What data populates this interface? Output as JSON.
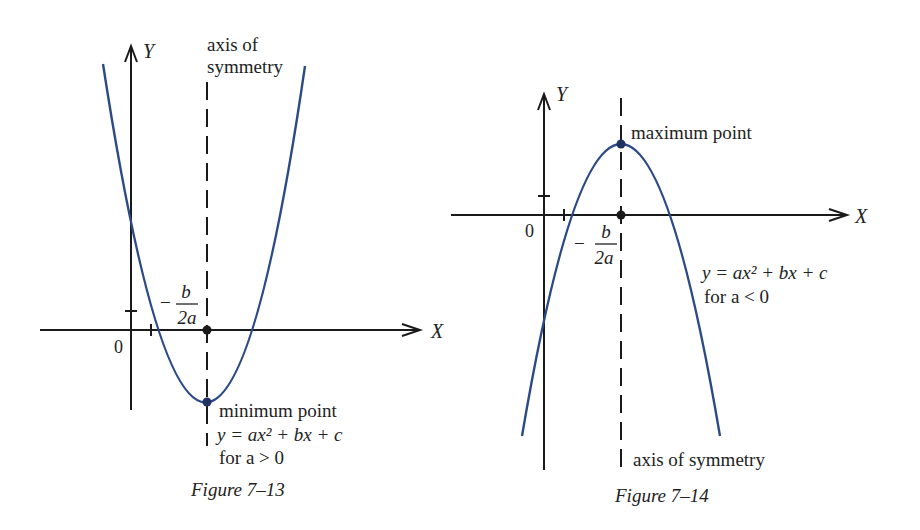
{
  "colors": {
    "axis": "#1a1a1a",
    "curve": "#2b4a86",
    "text": "#222222",
    "background": "#ffffff"
  },
  "figures": [
    {
      "caption": "Figure 7–13",
      "y_axis_label": "Y",
      "x_axis_label": "X",
      "origin_label": "0",
      "vertex_x_label_num": "b",
      "vertex_x_label_den": "2a",
      "vertex_x_label_sign": "−",
      "symmetry_label_line1": "axis of",
      "symmetry_label_line2": "symmetry",
      "point_label": "minimum point",
      "equation": "y = ax² + bx + c",
      "condition": "for a > 0",
      "opens": "up"
    },
    {
      "caption": "Figure 7–14",
      "y_axis_label": "Y",
      "x_axis_label": "X",
      "origin_label": "0",
      "vertex_x_label_num": "b",
      "vertex_x_label_den": "2a",
      "vertex_x_label_sign": "−",
      "symmetry_label": "axis of symmetry",
      "point_label": "maximum point",
      "equation": "y = ax² + bx + c",
      "condition": "for a < 0",
      "opens": "down"
    }
  ]
}
